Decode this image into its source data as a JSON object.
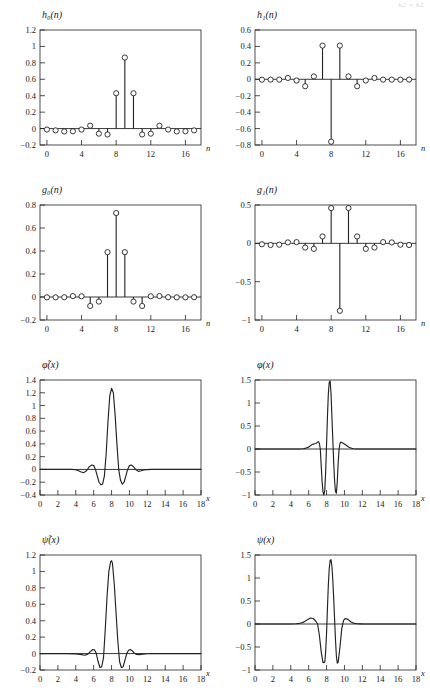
{
  "figure": {
    "corner_note": "h2 = h2",
    "xlabel_discrete": "n",
    "xlabel_continuous": "x"
  },
  "chart_data": [
    {
      "type": "bar",
      "subtype": "stem",
      "title": "h₀(n)",
      "xlabel": "n",
      "ylabel": "",
      "xlim": [
        -0.8,
        17.8
      ],
      "ylim": [
        -0.2,
        1.2
      ],
      "xticks": [
        0,
        4,
        8,
        12,
        16
      ],
      "yticks": [
        -0.2,
        0,
        0.2,
        0.4,
        0.6,
        0.8,
        1,
        1.2
      ],
      "ytick_labels": [
        "-0.2",
        "0",
        "0.2",
        "0.4",
        "0.6",
        "0.8",
        "1",
        "1.2"
      ],
      "grid": false,
      "categories": [
        0,
        1,
        2,
        3,
        4,
        5,
        6,
        7,
        8,
        9,
        10,
        11,
        12,
        13,
        14,
        15,
        16,
        17
      ],
      "values": [
        -0.012,
        -0.022,
        -0.035,
        -0.033,
        -0.012,
        0.035,
        -0.062,
        -0.072,
        0.43,
        0.865,
        0.43,
        -0.072,
        -0.062,
        0.035,
        -0.012,
        -0.035,
        -0.033,
        -0.022
      ]
    },
    {
      "type": "bar",
      "subtype": "stem",
      "title": "h₁(n)",
      "xlabel": "n",
      "ylabel": "",
      "xlim": [
        -0.8,
        17.8
      ],
      "ylim": [
        -0.8,
        0.6
      ],
      "xticks": [
        0,
        4,
        8,
        12,
        16
      ],
      "yticks": [
        -0.8,
        -0.6,
        -0.4,
        -0.2,
        0,
        0.2,
        0.4,
        0.6
      ],
      "ytick_labels": [
        "-0.8",
        "-0.6",
        "-0.4",
        "-0.2",
        "0",
        "0.2",
        "0.4",
        "0.6"
      ],
      "grid": false,
      "categories": [
        0,
        1,
        2,
        3,
        4,
        5,
        6,
        7,
        8,
        9,
        10,
        11,
        12,
        13,
        14,
        15,
        16,
        17
      ],
      "values": [
        -0.005,
        -0.004,
        -0.004,
        0.016,
        -0.015,
        -0.085,
        0.035,
        0.41,
        -0.76,
        0.41,
        0.035,
        -0.085,
        -0.015,
        0.016,
        -0.004,
        -0.004,
        -0.005,
        -0.004
      ]
    },
    {
      "type": "bar",
      "subtype": "stem",
      "title": "g₀(n)",
      "xlabel": "n",
      "ylabel": "",
      "xlim": [
        -0.8,
        17.8
      ],
      "ylim": [
        -0.2,
        0.8
      ],
      "xticks": [
        0,
        4,
        8,
        12,
        16
      ],
      "yticks": [
        -0.2,
        0,
        0.2,
        0.4,
        0.6,
        0.8
      ],
      "ytick_labels": [
        "-0.2",
        "0",
        "0.2",
        "0.4",
        "0.6",
        "0.8"
      ],
      "grid": false,
      "categories": [
        0,
        1,
        2,
        3,
        4,
        5,
        6,
        7,
        8,
        9,
        10,
        11,
        12,
        13,
        14,
        15,
        16,
        17
      ],
      "values": [
        -0.003,
        -0.003,
        -0.002,
        0.008,
        0.006,
        -0.078,
        -0.04,
        0.39,
        0.73,
        0.39,
        -0.04,
        -0.078,
        0.006,
        0.008,
        -0.002,
        -0.003,
        -0.003,
        -0.002
      ]
    },
    {
      "type": "bar",
      "subtype": "stem",
      "title": "g₁(n)",
      "xlabel": "n",
      "ylabel": "",
      "xlim": [
        -0.8,
        17.8
      ],
      "ylim": [
        -1.0,
        0.5
      ],
      "xticks": [
        0,
        4,
        8,
        12,
        16
      ],
      "yticks": [
        -1.0,
        -0.5,
        0,
        0.5
      ],
      "ytick_labels": [
        "-1",
        "-0.5",
        "0",
        "0.5"
      ],
      "grid": false,
      "categories": [
        0,
        1,
        2,
        3,
        4,
        5,
        6,
        7,
        8,
        9,
        10,
        11,
        12,
        13,
        14,
        15,
        16,
        17
      ],
      "values": [
        -0.012,
        -0.022,
        -0.018,
        0.012,
        0.016,
        -0.055,
        -0.072,
        0.09,
        0.46,
        -0.88,
        0.46,
        0.09,
        -0.072,
        -0.055,
        0.016,
        0.012,
        -0.018,
        -0.022
      ]
    },
    {
      "type": "line",
      "title": "φ̃(x)",
      "xlabel": "x",
      "ylabel": "",
      "xlim": [
        0,
        18
      ],
      "ylim": [
        -0.4,
        1.4
      ],
      "xticks": [
        0,
        2,
        4,
        6,
        8,
        10,
        12,
        14,
        16,
        18
      ],
      "yticks": [
        -0.4,
        -0.2,
        0,
        0.2,
        0.4,
        0.6,
        0.8,
        1,
        1.2,
        1.4
      ],
      "ytick_labels": [
        "-0.4",
        "-0.2",
        "0",
        "0.2",
        "0.4",
        "0.6",
        "0.8",
        "1",
        "1.2",
        "1.4"
      ],
      "grid": false,
      "x": [
        0,
        0.5,
        1,
        1.5,
        2,
        2.5,
        3,
        3.5,
        4,
        4.3,
        4.6,
        4.9,
        5.2,
        5.5,
        5.8,
        6,
        6.2,
        6.4,
        6.6,
        6.8,
        7,
        7.2,
        7.4,
        7.6,
        7.8,
        8,
        8.2,
        8.4,
        8.6,
        8.8,
        9,
        9.2,
        9.4,
        9.6,
        9.8,
        10,
        10.2,
        10.4,
        10.7,
        11,
        11.3,
        11.6,
        12,
        12.5,
        13,
        14,
        15,
        16,
        17,
        18
      ],
      "y": [
        0,
        0,
        0,
        0,
        0,
        0,
        0,
        0,
        -0.005,
        -0.02,
        -0.04,
        -0.05,
        -0.02,
        0.04,
        0.07,
        0.06,
        0.0,
        -0.1,
        -0.2,
        -0.24,
        -0.23,
        -0.1,
        0.25,
        0.75,
        1.15,
        1.27,
        1.2,
        0.85,
        0.4,
        0.0,
        -0.17,
        -0.23,
        -0.2,
        -0.1,
        0.0,
        0.06,
        0.07,
        0.05,
        0.0,
        -0.03,
        -0.02,
        -0.008,
        -0.002,
        0,
        0,
        0,
        0,
        0,
        0,
        0
      ]
    },
    {
      "type": "line",
      "title": "φ(x)",
      "xlabel": "x",
      "ylabel": "",
      "xlim": [
        0,
        18
      ],
      "ylim": [
        -1.0,
        1.5
      ],
      "xticks": [
        0,
        2,
        4,
        6,
        8,
        10,
        12,
        14,
        16,
        18
      ],
      "yticks": [
        -1.0,
        -0.5,
        0,
        0.5,
        1,
        1.5
      ],
      "ytick_labels": [
        "-1",
        "-0.5",
        "0",
        "0.5",
        "1",
        "1.5"
      ],
      "grid": false,
      "x": [
        0,
        1,
        2,
        3,
        4,
        5,
        5.4,
        5.7,
        6,
        6.2,
        6.4,
        6.6,
        6.8,
        7,
        7.1,
        7.2,
        7.3,
        7.4,
        7.5,
        7.6,
        7.7,
        7.8,
        7.9,
        8.0,
        8.1,
        8.2,
        8.3,
        8.4,
        8.5,
        8.6,
        8.7,
        8.8,
        8.9,
        9.0,
        9.1,
        9.2,
        9.3,
        9.4,
        9.5,
        9.6,
        9.8,
        10,
        10.2,
        10.5,
        10.8,
        11,
        11.3,
        11.6,
        12,
        13,
        14,
        15,
        16,
        17,
        18
      ],
      "y": [
        0,
        0,
        0,
        0,
        0,
        0,
        0.005,
        0.02,
        0.04,
        0.07,
        0.1,
        0.11,
        0.12,
        0.15,
        0.16,
        0.12,
        0.0,
        -0.35,
        -0.7,
        -0.93,
        -1.0,
        -0.9,
        -0.5,
        0.1,
        0.7,
        1.2,
        1.45,
        1.48,
        1.2,
        0.7,
        0.2,
        -0.3,
        -0.7,
        -0.93,
        -0.96,
        -0.7,
        -0.3,
        0.0,
        0.12,
        0.15,
        0.13,
        0.11,
        0.08,
        0.04,
        0.015,
        0.005,
        0,
        0,
        0,
        0,
        0,
        0,
        0,
        0,
        0
      ]
    },
    {
      "type": "line",
      "title": "ψ̃(x)",
      "xlabel": "x",
      "ylabel": "",
      "xlim": [
        0,
        18
      ],
      "ylim": [
        -0.2,
        1.2
      ],
      "xticks": [
        0,
        2,
        4,
        6,
        8,
        10,
        12,
        14,
        16,
        18
      ],
      "yticks": [
        -0.2,
        0,
        0.2,
        0.4,
        0.6,
        0.8,
        1,
        1.2
      ],
      "ytick_labels": [
        "-0.2",
        "0",
        "0.2",
        "0.4",
        "0.6",
        "0.8",
        "1",
        "1.2"
      ],
      "grid": false,
      "x": [
        0,
        1,
        2,
        3,
        4,
        4.5,
        5,
        5.3,
        5.6,
        5.9,
        6.1,
        6.3,
        6.5,
        6.7,
        6.9,
        7.1,
        7.3,
        7.5,
        7.7,
        7.9,
        8.0,
        8.1,
        8.3,
        8.5,
        8.7,
        8.9,
        9.1,
        9.3,
        9.5,
        9.7,
        9.9,
        10.1,
        10.3,
        10.5,
        10.8,
        11.1,
        11.5,
        12,
        13,
        14,
        15,
        16,
        17,
        18
      ],
      "y": [
        0,
        0,
        0,
        0,
        -0.004,
        -0.01,
        -0.02,
        -0.01,
        0.02,
        0.05,
        0.045,
        0.0,
        -0.1,
        -0.17,
        -0.16,
        -0.05,
        0.3,
        0.7,
        1.0,
        1.12,
        1.13,
        1.1,
        0.85,
        0.5,
        0.15,
        -0.1,
        -0.17,
        -0.16,
        -0.08,
        0.0,
        0.04,
        0.05,
        0.035,
        0.01,
        -0.01,
        -0.012,
        -0.006,
        -0.002,
        0,
        0,
        0,
        0,
        0,
        0
      ]
    },
    {
      "type": "line",
      "title": "ψ(x)",
      "xlabel": "x",
      "ylabel": "",
      "xlim": [
        0,
        18
      ],
      "ylim": [
        -1.0,
        1.5
      ],
      "xticks": [
        0,
        2,
        4,
        6,
        8,
        10,
        12,
        14,
        16,
        18
      ],
      "yticks": [
        -1.0,
        -0.5,
        0,
        0.5,
        1,
        1.5
      ],
      "ytick_labels": [
        "-1",
        "-0.5",
        "0",
        "0.5",
        "1",
        "1.5"
      ],
      "grid": false,
      "x": [
        0,
        1,
        2,
        3,
        4,
        4.6,
        5,
        5.3,
        5.6,
        5.9,
        6.2,
        6.5,
        6.8,
        7.0,
        7.2,
        7.4,
        7.6,
        7.8,
        7.9,
        8.0,
        8.1,
        8.2,
        8.3,
        8.4,
        8.5,
        8.6,
        8.7,
        8.8,
        8.9,
        9.0,
        9.1,
        9.2,
        9.3,
        9.5,
        9.7,
        9.9,
        10.1,
        10.4,
        10.7,
        11,
        11.4,
        11.8,
        12.2,
        13,
        14,
        15,
        16,
        17,
        18
      ],
      "y": [
        0,
        0,
        0,
        0,
        0,
        0.005,
        0.015,
        0.03,
        0.06,
        0.1,
        0.13,
        0.12,
        0.06,
        0.0,
        -0.25,
        -0.6,
        -0.84,
        -0.83,
        -0.6,
        -0.2,
        0.35,
        0.85,
        1.2,
        1.38,
        1.4,
        1.25,
        0.95,
        0.55,
        0.1,
        -0.35,
        -0.7,
        -0.85,
        -0.83,
        -0.5,
        -0.1,
        0.08,
        0.12,
        0.1,
        0.05,
        0.02,
        0.005,
        0.002,
        0,
        0,
        0,
        0,
        0,
        0,
        0
      ]
    }
  ]
}
